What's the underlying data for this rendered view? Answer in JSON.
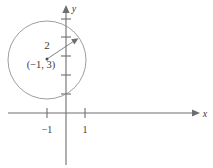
{
  "figure": {
    "type": "coordinate-plane-circle-graph",
    "axes": {
      "x_label": "x",
      "y_label": "y",
      "x_ticks": [
        {
          "label": "−1",
          "value": -1
        },
        {
          "label": "1",
          "value": 1
        }
      ],
      "y_ticks": [
        {
          "label": "",
          "value": 1
        },
        {
          "label": "",
          "value": 2
        },
        {
          "label": "",
          "value": 3
        },
        {
          "label": "",
          "value": 4
        },
        {
          "label": "",
          "value": 5
        }
      ]
    },
    "circle": {
      "center_label": "(−1, 3)",
      "center_x": -1,
      "center_y": 3,
      "radius_label": "2",
      "radius_value": 2
    },
    "colors": {
      "axis": "#6e6e6e",
      "curve": "#8d8d8d",
      "text": "#3b3b3b",
      "background": "#ffffff"
    }
  }
}
